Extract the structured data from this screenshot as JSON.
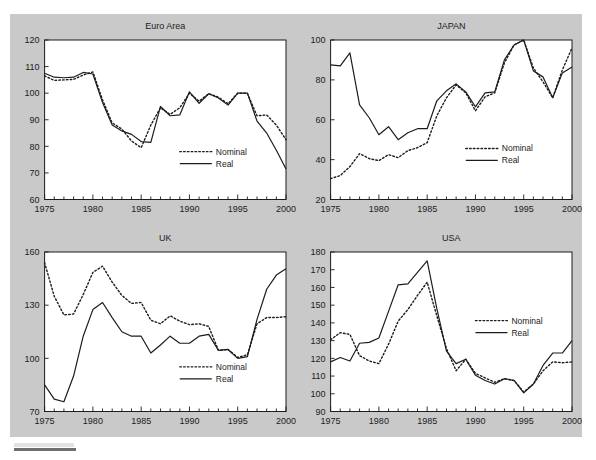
{
  "figure": {
    "panel_background": "#c9c9c9",
    "plot_background": "#ffffff",
    "ink_color": "#1c1c1c",
    "legend": {
      "nominal_label": "Nominal",
      "real_label": "Real"
    }
  },
  "chart_data": [
    {
      "type": "line",
      "title": "Euro Area",
      "xlabel": "",
      "ylabel": "",
      "xlim": [
        1975,
        2000
      ],
      "ylim": [
        60,
        120
      ],
      "yticks": [
        60,
        70,
        80,
        90,
        100,
        110,
        120
      ],
      "xticks": [
        1975,
        1980,
        1985,
        1990,
        1995,
        2000
      ],
      "xtick_labels": [
        "1975",
        "1980",
        "1985",
        "1990",
        "1995",
        "2000"
      ],
      "ytick_labels": [
        "60",
        "70",
        "80",
        "90",
        "100",
        "110",
        "120"
      ],
      "grid": false,
      "legend_position": "lower right",
      "x": [
        1975,
        1976,
        1977,
        1978,
        1979,
        1980,
        1981,
        1982,
        1983,
        1984,
        1985,
        1986,
        1987,
        1988,
        1989,
        1990,
        1991,
        1992,
        1993,
        1994,
        1995,
        1996,
        1997,
        1998,
        1999,
        2000
      ],
      "series": [
        {
          "name": "Nominal",
          "values": [
            106.5,
            104.8,
            105.0,
            105.2,
            106.8,
            108.0,
            97.5,
            88.8,
            86.5,
            82.0,
            79.5,
            88.0,
            94.5,
            92.0,
            94.5,
            100.0,
            97.0,
            99.8,
            98.5,
            96.0,
            100.0,
            100.0,
            91.5,
            91.8,
            88.0,
            82.5
          ]
        },
        {
          "name": "Real",
          "values": [
            107.5,
            106.0,
            105.8,
            106.0,
            107.8,
            107.2,
            96.5,
            88.0,
            85.8,
            84.5,
            81.8,
            81.5,
            95.0,
            91.5,
            91.8,
            100.5,
            96.2,
            99.8,
            98.2,
            95.5,
            100.0,
            100.0,
            89.5,
            85.0,
            78.5,
            71.5
          ]
        }
      ]
    },
    {
      "type": "line",
      "title": "JAPAN",
      "xlabel": "",
      "ylabel": "",
      "xlim": [
        1975,
        2000
      ],
      "ylim": [
        20,
        100
      ],
      "yticks": [
        20,
        40,
        60,
        80,
        100
      ],
      "xticks": [
        1975,
        1980,
        1985,
        1990,
        1995,
        2000
      ],
      "xtick_labels": [
        "1975",
        "1980",
        "1985",
        "1990",
        "1995",
        "2000"
      ],
      "ytick_labels": [
        "20",
        "40",
        "60",
        "80",
        "100"
      ],
      "grid": false,
      "legend_position": "lower right",
      "x": [
        1975,
        1976,
        1977,
        1978,
        1979,
        1980,
        1981,
        1982,
        1983,
        1984,
        1985,
        1986,
        1987,
        1988,
        1989,
        1990,
        1991,
        1992,
        1993,
        1994,
        1995,
        1996,
        1997,
        1998,
        1999,
        2000
      ],
      "series": [
        {
          "name": "Nominal",
          "values": [
            30.5,
            32.0,
            36.5,
            43.0,
            40.5,
            39.5,
            42.5,
            41.0,
            44.5,
            46.0,
            48.5,
            62.0,
            71.0,
            77.5,
            73.5,
            64.5,
            71.5,
            73.5,
            88.5,
            97.5,
            100.0,
            86.0,
            79.0,
            71.0,
            85.0,
            96.0
          ]
        },
        {
          "name": "Real",
          "values": [
            87.5,
            87.0,
            93.5,
            67.5,
            61.0,
            52.5,
            56.5,
            50.0,
            53.5,
            55.5,
            55.5,
            69.5,
            74.5,
            78.0,
            74.0,
            66.5,
            73.5,
            74.0,
            90.0,
            97.5,
            100.0,
            84.5,
            81.5,
            71.0,
            83.5,
            86.5
          ]
        }
      ]
    },
    {
      "type": "line",
      "title": "UK",
      "xlabel": "",
      "ylabel": "",
      "xlim": [
        1975,
        2000
      ],
      "ylim": [
        70,
        160
      ],
      "yticks": [
        70,
        100,
        130,
        160
      ],
      "xticks": [
        1975,
        1980,
        1985,
        1990,
        1995,
        2000
      ],
      "xtick_labels": [
        "1975",
        "1980",
        "1985",
        "1990",
        "1995",
        "2000"
      ],
      "ytick_labels": [
        "70",
        "100",
        "130",
        "160"
      ],
      "grid": false,
      "legend_position": "lower right",
      "x": [
        1975,
        1976,
        1977,
        1978,
        1979,
        1980,
        1981,
        1982,
        1983,
        1984,
        1985,
        1986,
        1987,
        1988,
        1989,
        1990,
        1991,
        1992,
        1993,
        1994,
        1995,
        1996,
        1997,
        1998,
        1999,
        2000
      ],
      "series": [
        {
          "name": "Nominal",
          "values": [
            154.0,
            135.0,
            124.5,
            125.0,
            136.0,
            148.5,
            152.0,
            143.0,
            135.5,
            131.0,
            131.5,
            121.5,
            119.5,
            124.0,
            121.0,
            119.0,
            119.5,
            118.0,
            104.5,
            105.0,
            100.5,
            102.0,
            119.5,
            123.0,
            123.0,
            123.5
          ]
        },
        {
          "name": "Real",
          "values": [
            85.0,
            77.0,
            75.5,
            90.0,
            112.5,
            127.5,
            131.5,
            123.0,
            115.0,
            112.5,
            112.5,
            103.0,
            107.5,
            112.5,
            108.5,
            108.5,
            112.5,
            113.5,
            104.5,
            105.0,
            100.0,
            101.0,
            122.0,
            139.0,
            147.0,
            150.5
          ]
        }
      ]
    },
    {
      "type": "line",
      "title": "USA",
      "xlabel": "",
      "ylabel": "",
      "xlim": [
        1975,
        2000
      ],
      "ylim": [
        90,
        180
      ],
      "yticks": [
        90,
        100,
        110,
        120,
        130,
        140,
        150,
        160,
        170,
        180
      ],
      "xticks": [
        1975,
        1980,
        1985,
        1990,
        1995,
        2000
      ],
      "xtick_labels": [
        "1975",
        "1980",
        "1985",
        "1990",
        "1995",
        "2000"
      ],
      "ytick_labels": [
        "90",
        "100",
        "110",
        "120",
        "130",
        "140",
        "150",
        "160",
        "170",
        "180"
      ],
      "grid": false,
      "legend_position": "center right",
      "x": [
        1975,
        1976,
        1977,
        1978,
        1979,
        1980,
        1981,
        1982,
        1983,
        1984,
        1985,
        1986,
        1987,
        1988,
        1989,
        1990,
        1991,
        1992,
        1993,
        1994,
        1995,
        1996,
        1997,
        1998,
        1999,
        2000
      ],
      "series": [
        {
          "name": "Nominal",
          "values": [
            130.5,
            134.5,
            133.5,
            121.5,
            118.5,
            117.0,
            128.0,
            141.0,
            147.5,
            155.5,
            163.0,
            144.0,
            125.5,
            113.0,
            119.5,
            111.5,
            109.0,
            106.5,
            108.5,
            107.5,
            101.0,
            105.5,
            113.0,
            118.0,
            117.5,
            118.0
          ]
        },
        {
          "name": "Real",
          "values": [
            118.0,
            120.5,
            118.5,
            128.5,
            129.0,
            131.5,
            146.5,
            161.5,
            162.0,
            168.5,
            175.0,
            148.0,
            124.0,
            117.0,
            119.5,
            110.5,
            107.5,
            105.5,
            108.5,
            107.5,
            100.5,
            105.5,
            116.0,
            123.0,
            123.0,
            130.0
          ]
        }
      ]
    }
  ]
}
